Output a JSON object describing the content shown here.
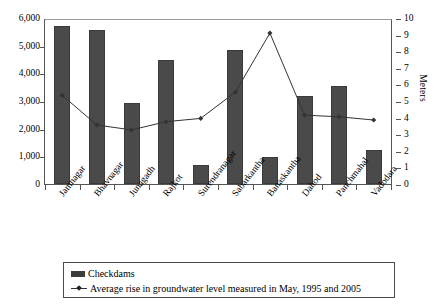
{
  "chart_data": {
    "type": "bar",
    "title": "",
    "xlabel": "",
    "ylabel": "",
    "ylabel_right": "Meters",
    "grid": false,
    "legend_position": "bottom",
    "categories": [
      "Jamnagar",
      "Bhavnagar",
      "Junagadh",
      "Rajkot",
      "Surendranagar",
      "Sabarkantha",
      "Banaskantha",
      "Dahod",
      "Panchmahal",
      "Vadodara"
    ],
    "ylim": [
      0,
      6000
    ],
    "yticks": [
      "0",
      "1,000",
      "2,000",
      "3,000",
      "4,000",
      "5,000",
      "6,000"
    ],
    "ytick_values": [
      0,
      1000,
      2000,
      3000,
      4000,
      5000,
      6000
    ],
    "ylim_right": [
      0,
      10
    ],
    "yticks_right": [
      "0",
      "1",
      "2",
      "3",
      "4",
      "5",
      "6",
      "7",
      "8",
      "9",
      "10"
    ],
    "ytick_values_right": [
      0,
      1,
      2,
      3,
      4,
      5,
      6,
      7,
      8,
      9,
      10
    ],
    "series": [
      {
        "name": "Checkdams",
        "type": "bar",
        "axis": "left",
        "color": "#4a4a4a",
        "values": [
          5780,
          5640,
          2960,
          4540,
          700,
          4900,
          1000,
          3230,
          3590,
          1230
        ]
      },
      {
        "name": "Average rise in groundwater level measured in May, 1995 and 2005",
        "type": "line",
        "axis": "right",
        "color": "#333333",
        "values": [
          5.4,
          3.6,
          3.3,
          3.8,
          4.0,
          5.6,
          9.2,
          4.2,
          4.1,
          3.9
        ]
      }
    ]
  },
  "legend": {
    "items": [
      {
        "label": "Checkdams",
        "marker": "bar-swatch"
      },
      {
        "label": "Average rise in groundwater level measured in May, 1995 and 2005",
        "marker": "line-marker"
      }
    ]
  }
}
